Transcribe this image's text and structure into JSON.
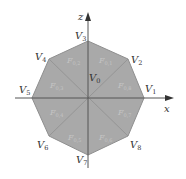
{
  "diagram": {
    "type": "octagon-partition",
    "colors": {
      "fill": "#a9a9a9",
      "edge": "#8f8f8f",
      "axis": "#555555",
      "vertex_label": "#333333",
      "face_label": "#c4c4c4"
    },
    "axes": {
      "x": {
        "label": "x"
      },
      "z": {
        "label": "z"
      }
    },
    "vertices": [
      {
        "name": "V",
        "sub": "0",
        "x": 89,
        "y": 81
      },
      {
        "name": "V",
        "sub": "1",
        "x": 148,
        "y": 92
      },
      {
        "name": "V",
        "sub": "2",
        "x": 131,
        "y": 63
      },
      {
        "name": "V",
        "sub": "3",
        "x": 77,
        "y": 39
      },
      {
        "name": "V",
        "sub": "4",
        "x": 35,
        "y": 60
      },
      {
        "name": "V",
        "sub": "5",
        "x": 19,
        "y": 93
      },
      {
        "name": "V",
        "sub": "6",
        "x": 37,
        "y": 148
      },
      {
        "name": "V",
        "sub": "7",
        "x": 76,
        "y": 163
      },
      {
        "name": "V",
        "sub": "8",
        "x": 130,
        "y": 148
      }
    ],
    "faces": [
      {
        "name": "F",
        "sub": "0,1",
        "x": 99,
        "y": 63
      },
      {
        "name": "F",
        "sub": "0,2",
        "x": 67,
        "y": 63
      },
      {
        "name": "F",
        "sub": "0,3",
        "x": 50,
        "y": 88
      },
      {
        "name": "F",
        "sub": "0,4",
        "x": 50,
        "y": 115
      },
      {
        "name": "F",
        "sub": "0,5",
        "x": 68,
        "y": 140
      },
      {
        "name": "F",
        "sub": "0,6",
        "x": 99,
        "y": 140
      },
      {
        "name": "F",
        "sub": "0,7",
        "x": 118,
        "y": 115
      },
      {
        "name": "F",
        "sub": "0,8",
        "x": 118,
        "y": 88
      }
    ]
  }
}
